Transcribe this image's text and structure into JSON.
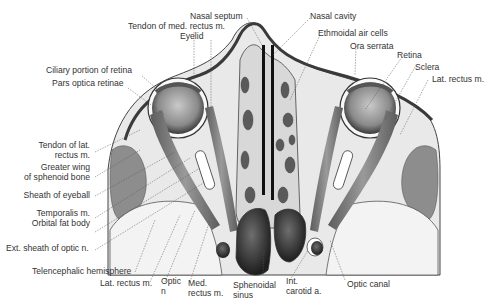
{
  "figure": {
    "colors": {
      "background": "#ffffff",
      "ink": "#333333",
      "tissue": "#e6e6e6",
      "muscle": "#7a7a7a",
      "dark": "#2a2a2a"
    }
  },
  "labels": {
    "nasal_septum": "Nasal septum",
    "tendon_med_rectus": "Tendon of med. rectus m.",
    "eyelid": "Eyelid",
    "ciliary_portion": "Ciliary portion of retina",
    "pars_optica": "Pars optica retinae",
    "tendon_lat_rectus": "Tendon of lat.\nrectus m.",
    "greater_wing": "Greater wing\nof sphenoid bone",
    "sheath_eyeball": "Sheath of eyeball",
    "temporalis": "Temporalis m.",
    "orbital_fat": "Orbital fat body",
    "ext_sheath_optic": "Ext. sheath of optic n.",
    "telencephalic": "Telencephalic hemisphere",
    "lat_rectus_bottom": "Lat. rectus m.",
    "optic_n": "Optic\nn",
    "med_rectus": "Med.\nrectus m.",
    "sphenoidal_sinus": "Sphenoidal\nsinus",
    "int_carotid": "Int.\ncarotid a.",
    "optic_canal": "Optic canal",
    "nasal_cavity": "Nasal cavity",
    "ethmoidal_air_cells": "Ethmoidal air cells",
    "ora_serrata": "Ora serrata",
    "retina": "Retina",
    "sclera": "Sclera",
    "lat_rectus_right": "Lat. rectus m."
  }
}
